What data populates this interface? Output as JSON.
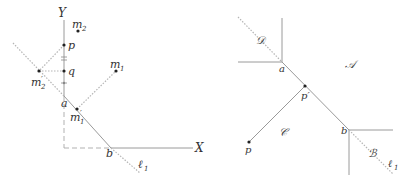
{
  "left_figure": {
    "axes": {
      "x_label": "X",
      "y_label": "Y"
    },
    "line_label": "ℓ",
    "line_label_sub": "1",
    "points": {
      "p": "p",
      "q": "q",
      "a": "a",
      "b": "b",
      "m1": {
        "base": "m",
        "sub": "1"
      },
      "m2": {
        "base": "m",
        "sub": "2"
      },
      "m1_prime": {
        "base": "m",
        "sub": "1",
        "prime": "′"
      },
      "m2_prime": {
        "base": "m",
        "sub": "2",
        "prime": "′"
      }
    }
  },
  "right_figure": {
    "regions": {
      "A": "𝒜",
      "B": "ℬ",
      "C": "𝒞",
      "D": "𝒟"
    },
    "line_label": "ℓ",
    "line_label_sub": "1",
    "points": {
      "a": "a",
      "b": "b",
      "p": "p",
      "p_prime": "p′"
    }
  },
  "colors": {
    "line": "#9a9a9a",
    "point": "#222222",
    "text": "#333333"
  }
}
